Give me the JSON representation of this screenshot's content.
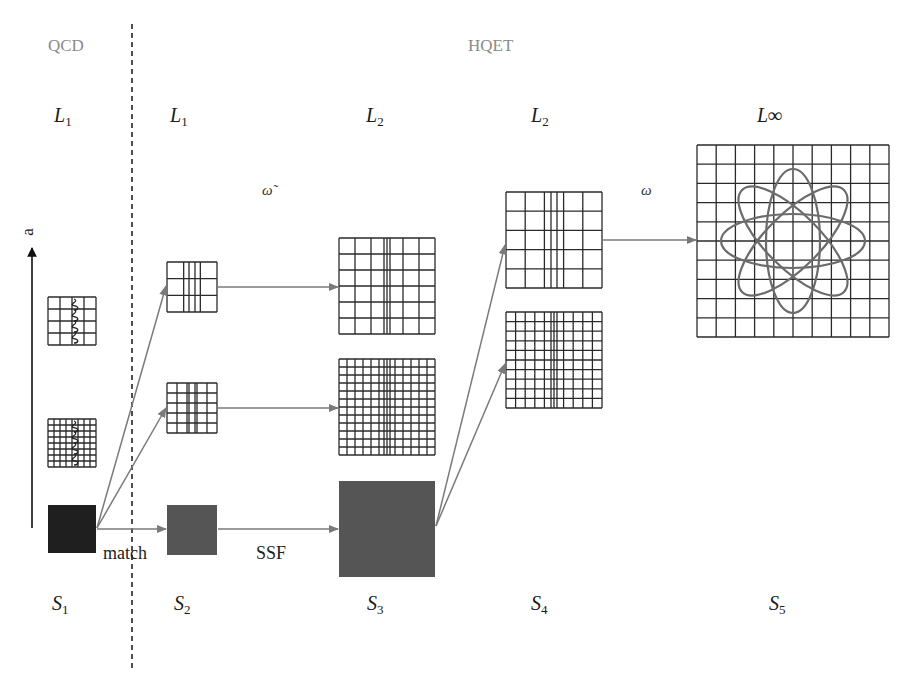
{
  "regions": {
    "left": "QCD",
    "right": "HQET"
  },
  "axis": {
    "label": "a"
  },
  "levels": [
    {
      "id": "L1-qcd",
      "base": "L",
      "sub": "1",
      "x": 64
    },
    {
      "id": "L1-hqet",
      "base": "L",
      "sub": "1",
      "x": 180
    },
    {
      "id": "L2-a",
      "base": "L",
      "sub": "2",
      "x": 376
    },
    {
      "id": "L2-b",
      "base": "L",
      "sub": "2",
      "x": 541
    },
    {
      "id": "Linf",
      "base": "L∞",
      "sub": "",
      "x": 767
    }
  ],
  "steps": [
    {
      "id": "S1",
      "base": "S",
      "sub": "1",
      "x": 62
    },
    {
      "id": "S2",
      "base": "S",
      "sub": "2",
      "x": 184
    },
    {
      "id": "S3",
      "base": "S",
      "sub": "3",
      "x": 377
    },
    {
      "id": "S4",
      "base": "S",
      "sub": "4",
      "x": 541
    },
    {
      "id": "S5",
      "base": "S",
      "sub": "5",
      "x": 779
    }
  ],
  "annotations": {
    "omega_tilde": "ω̃",
    "omega": "ω",
    "match": "match",
    "ssf": "SSF"
  },
  "colors": {
    "grid_line": "#2a2a2a",
    "arrow": "#7a7a7a",
    "orbit": "#6b6b6b",
    "box_dark": "#1f1f1f",
    "box_mid": "#555555",
    "region_text": "#8a8a8a"
  },
  "lattices": [
    {
      "id": "qcd-coarse",
      "x": 48,
      "y": 297,
      "size": 48,
      "n": 4,
      "wave": true
    },
    {
      "id": "qcd-fine",
      "x": 48,
      "y": 419,
      "size": 48,
      "n": 8,
      "wave": true
    },
    {
      "id": "s2-coarse",
      "x": 167,
      "y": 262,
      "size": 50,
      "n": 3,
      "doubled_center": true
    },
    {
      "id": "s2-fine",
      "x": 167,
      "y": 383,
      "size": 50,
      "n": 5,
      "doubled_center": true
    },
    {
      "id": "s3-coarse",
      "x": 339,
      "y": 238,
      "size": 96,
      "n": 6,
      "doubled_center": true
    },
    {
      "id": "s3-fine",
      "x": 339,
      "y": 359,
      "size": 96,
      "n": 12,
      "doubled_center": true
    },
    {
      "id": "s4-coarse",
      "x": 506,
      "y": 192,
      "size": 96,
      "n": 5,
      "doubled_center": true
    },
    {
      "id": "s4-fine",
      "x": 506,
      "y": 312,
      "size": 96,
      "n": 10,
      "doubled_center": true
    },
    {
      "id": "s5-infinite",
      "x": 697,
      "y": 145,
      "size": 192,
      "n": 10,
      "orbits": true
    }
  ],
  "boxes": [
    {
      "id": "s1-box",
      "x": 48,
      "y": 505,
      "size": 48,
      "color": "#1f1f1f"
    },
    {
      "id": "s2-box",
      "x": 167,
      "y": 505,
      "size": 50,
      "color": "#555555"
    },
    {
      "id": "s3-box",
      "x": 339,
      "y": 481,
      "size": 96,
      "color": "#555555"
    }
  ]
}
